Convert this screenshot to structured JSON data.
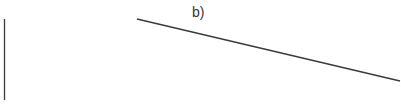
{
  "diagram": {
    "label": "b)",
    "label_pos": {
      "x": 192,
      "y": 5
    },
    "line_color": "#3a3a3a",
    "background": "#ffffff",
    "lines": [
      {
        "name": "vertical-line",
        "x1": 4.5,
        "y1": 19,
        "x2": 4.5,
        "y2": 100
      },
      {
        "name": "diagonal-line",
        "x1": 137,
        "y1": 19,
        "x2": 400,
        "y2": 81
      }
    ]
  }
}
